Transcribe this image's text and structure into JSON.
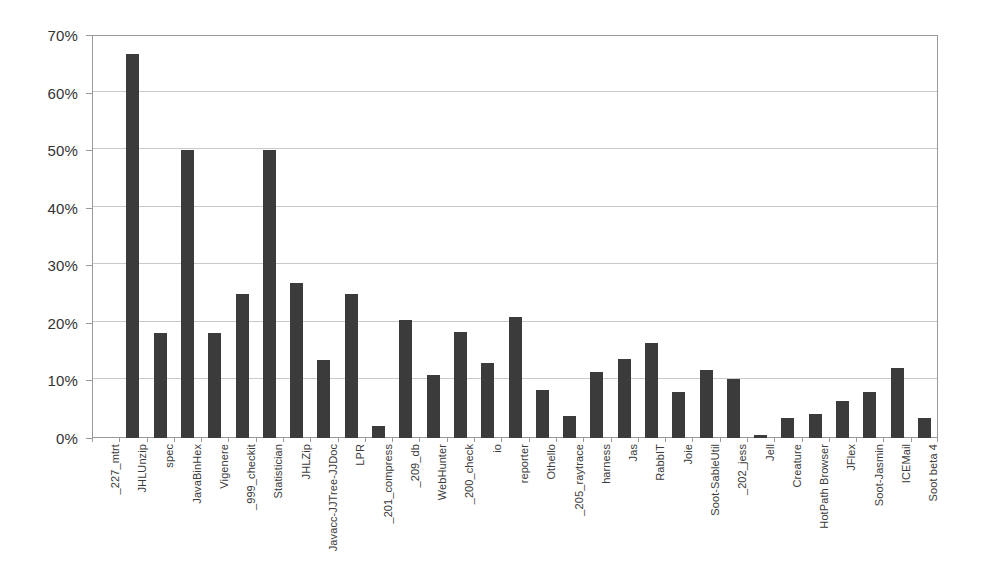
{
  "chart_data": {
    "type": "bar",
    "title": "",
    "subtitle": "",
    "xlabel": "",
    "ylabel": "",
    "ylim": [
      0,
      70
    ],
    "y_tick_labels": [
      "0%",
      "10%",
      "20%",
      "30%",
      "40%",
      "50%",
      "60%",
      "70%"
    ],
    "y_tick_values": [
      0,
      10,
      20,
      30,
      40,
      50,
      60,
      70
    ],
    "grid": true,
    "legend": false,
    "legend_position": "none",
    "bar_color": "#3b3b3b",
    "gridline_color": "#c9c9c9",
    "axis_color": "#999999",
    "background_color": "#ffffff",
    "categories": [
      "_227_mtrt",
      "JHLUnzip",
      "spec",
      "JavaBinHex",
      "Vigenere",
      "_999_checkit",
      "Statistician",
      "JHLZip",
      "Javacc-JJTree-JJDoc",
      "LPR",
      "_201_compress",
      "_209_db",
      "WebHunter",
      "_200_check",
      "io",
      "reporter",
      "Othello",
      "_205_raytrace",
      "harness",
      "Jas",
      "RabbIT",
      "Joie",
      "Soot-SableUtil",
      "_202_jess",
      "Jell",
      "Creature",
      "HotPath Browser",
      "JFlex",
      "Soot-Jasmin",
      "ICEMail",
      "Soot beta 4"
    ],
    "values": [
      0,
      66.7,
      18.3,
      50,
      18.3,
      25,
      50,
      27,
      13.6,
      25,
      2.1,
      20.5,
      11,
      18.5,
      13,
      21,
      8.3,
      3.9,
      11.5,
      13.7,
      16.5,
      8,
      11.9,
      10.2,
      0.5,
      3.4,
      4.2,
      6.4,
      8,
      12.2,
      3.4
    ]
  }
}
